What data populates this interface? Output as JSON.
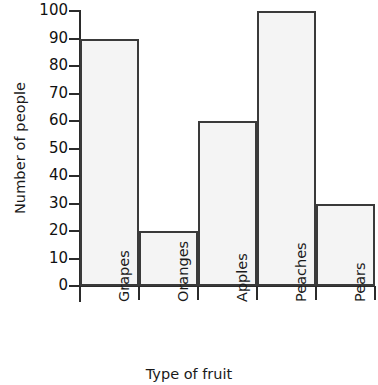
{
  "chart_data": {
    "type": "bar",
    "title": "",
    "xlabel": "Type of fruit",
    "ylabel": "Number of people",
    "categories": [
      "Grapes",
      "Oranges",
      "Apples",
      "Peaches",
      "Pears"
    ],
    "values": [
      90,
      20,
      60,
      100,
      30
    ],
    "ylim": [
      0,
      100
    ],
    "ytick_labels": [
      "100",
      "90",
      "80",
      "70",
      "60",
      "50",
      "40",
      "30",
      "20",
      "10",
      "0"
    ],
    "ytick_values": [
      100,
      90,
      80,
      70,
      60,
      50,
      40,
      30,
      20,
      10,
      0
    ],
    "ytick_step": 10,
    "grid": false,
    "legend": false,
    "bar_style": {
      "fill": "#f4f4f4",
      "stroke": "#3a3a3a",
      "gap": 0
    },
    "axis_color": "#2b2b2b",
    "background": "#ffffff"
  }
}
